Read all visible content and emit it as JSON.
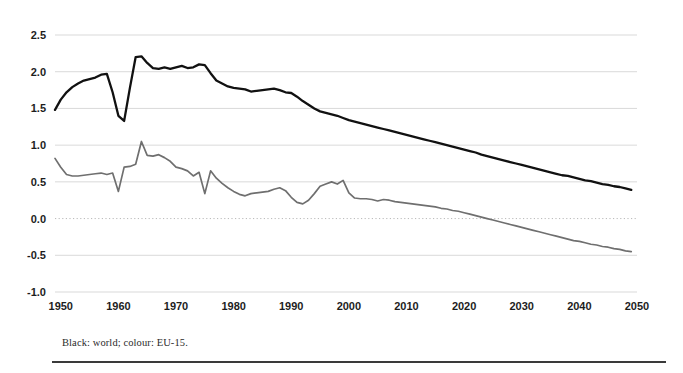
{
  "figure": {
    "caption": "Black: world; colour: EU-15.",
    "colors": {
      "world_line": "#111111",
      "eu_line": "#6f6f6f",
      "gridline": "#cfcfcf",
      "zero_line": "#b9b9b9",
      "text": "#1d1d1d"
    }
  },
  "chart_data": {
    "type": "line",
    "title": "",
    "subtitle": "",
    "xlabel": "",
    "ylabel": "",
    "xlim": [
      1949,
      2050
    ],
    "ylim": [
      -1.0,
      2.6
    ],
    "grid": true,
    "legend_position": "caption-below",
    "annotations": [
      "Black: world; colour: EU-15."
    ],
    "yticks": [
      "2.5",
      "2.0",
      "1.5",
      "1.0",
      "0.5",
      "0.0",
      "-0.5",
      "-1.0"
    ],
    "ytick_values": [
      2.5,
      2.0,
      1.5,
      1.0,
      0.5,
      0.0,
      -0.5,
      -1.0
    ],
    "xticks": [
      "1950",
      "1960",
      "1970",
      "1980",
      "1990",
      "2000",
      "2010",
      "2020",
      "2030",
      "2040",
      "2050"
    ],
    "xtick_values": [
      1950,
      1960,
      1970,
      1980,
      1990,
      2000,
      2010,
      2020,
      2030,
      2040,
      2050
    ],
    "zero_reference_line": 0.0,
    "x": [
      1949,
      1950,
      1951,
      1952,
      1953,
      1954,
      1955,
      1956,
      1957,
      1958,
      1959,
      1960,
      1961,
      1962,
      1963,
      1964,
      1965,
      1966,
      1967,
      1968,
      1969,
      1970,
      1971,
      1972,
      1973,
      1974,
      1975,
      1976,
      1977,
      1978,
      1979,
      1980,
      1981,
      1982,
      1983,
      1984,
      1985,
      1986,
      1987,
      1988,
      1989,
      1990,
      1991,
      1992,
      1993,
      1994,
      1995,
      1996,
      1997,
      1998,
      1999,
      2000,
      2001,
      2002,
      2003,
      2004,
      2005,
      2006,
      2007,
      2008,
      2009,
      2010,
      2011,
      2012,
      2013,
      2014,
      2015,
      2016,
      2017,
      2018,
      2019,
      2020,
      2021,
      2022,
      2023,
      2024,
      2025,
      2026,
      2027,
      2028,
      2029,
      2030,
      2031,
      2032,
      2033,
      2034,
      2035,
      2036,
      2037,
      2038,
      2039,
      2040,
      2041,
      2042,
      2043,
      2044,
      2045,
      2046,
      2047,
      2048,
      2049
    ],
    "series": [
      {
        "name": "World",
        "color": "#111111",
        "style": "solid",
        "values": [
          1.48,
          1.62,
          1.72,
          1.79,
          1.84,
          1.88,
          1.9,
          1.92,
          1.96,
          1.97,
          1.72,
          1.4,
          1.33,
          1.78,
          2.2,
          2.21,
          2.12,
          2.05,
          2.04,
          2.06,
          2.04,
          2.06,
          2.08,
          2.05,
          2.06,
          2.1,
          2.09,
          1.98,
          1.88,
          1.84,
          1.8,
          1.78,
          1.77,
          1.76,
          1.73,
          1.74,
          1.75,
          1.76,
          1.77,
          1.75,
          1.72,
          1.71,
          1.66,
          1.6,
          1.55,
          1.5,
          1.46,
          1.44,
          1.42,
          1.4,
          1.37,
          1.34,
          1.32,
          1.3,
          1.28,
          1.26,
          1.24,
          1.22,
          1.2,
          1.18,
          1.16,
          1.14,
          1.12,
          1.1,
          1.08,
          1.06,
          1.04,
          1.02,
          1.0,
          0.98,
          0.96,
          0.94,
          0.92,
          0.9,
          0.87,
          0.85,
          0.83,
          0.81,
          0.79,
          0.77,
          0.75,
          0.73,
          0.71,
          0.69,
          0.67,
          0.65,
          0.63,
          0.61,
          0.59,
          0.58,
          0.56,
          0.54,
          0.52,
          0.51,
          0.49,
          0.47,
          0.46,
          0.44,
          0.43,
          0.41,
          0.39
        ]
      },
      {
        "name": "EU-15",
        "color": "#6f6f6f",
        "style": "solid",
        "values": [
          0.82,
          0.7,
          0.6,
          0.58,
          0.58,
          0.59,
          0.6,
          0.61,
          0.62,
          0.6,
          0.62,
          0.37,
          0.7,
          0.71,
          0.74,
          1.05,
          0.86,
          0.85,
          0.87,
          0.83,
          0.78,
          0.7,
          0.68,
          0.65,
          0.58,
          0.63,
          0.34,
          0.65,
          0.55,
          0.48,
          0.42,
          0.37,
          0.33,
          0.31,
          0.34,
          0.35,
          0.36,
          0.37,
          0.4,
          0.42,
          0.38,
          0.29,
          0.22,
          0.2,
          0.25,
          0.34,
          0.44,
          0.47,
          0.5,
          0.47,
          0.52,
          0.35,
          0.28,
          0.27,
          0.27,
          0.26,
          0.24,
          0.26,
          0.25,
          0.23,
          0.22,
          0.21,
          0.2,
          0.19,
          0.18,
          0.17,
          0.16,
          0.14,
          0.13,
          0.11,
          0.1,
          0.08,
          0.06,
          0.04,
          0.02,
          0.0,
          -0.02,
          -0.04,
          -0.06,
          -0.08,
          -0.1,
          -0.12,
          -0.14,
          -0.16,
          -0.18,
          -0.2,
          -0.22,
          -0.24,
          -0.26,
          -0.28,
          -0.3,
          -0.31,
          -0.33,
          -0.35,
          -0.36,
          -0.38,
          -0.39,
          -0.41,
          -0.42,
          -0.44,
          -0.45
        ]
      }
    ]
  }
}
